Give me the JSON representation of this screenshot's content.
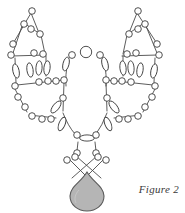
{
  "figure": {
    "caption": "Figure 2",
    "canvas": {
      "width": 185,
      "height": 213
    },
    "background_color": "#ffffff"
  },
  "style": {
    "bead_outline_color": "#3c3c3c",
    "bead_fill_color": "#ffffff",
    "thread_color": "#4a4a4a",
    "pendant_fill_color": "#b5b5b5",
    "pendant_outline_color": "#5a5a5a",
    "thread_width": 0.9,
    "bead_outline_width": 0.9
  },
  "components": {
    "left_wing_label": "left-wing-motif",
    "right_wing_label": "right-wing-motif",
    "center_loop_label": "center-loop-motif",
    "crossover_label": "crossover-strands",
    "pendant_label": "teardrop-pendant"
  },
  "threads": [
    {
      "name": "left-upper-v-left",
      "x1": 31,
      "y1": 13,
      "x2": 13,
      "y2": 41
    },
    {
      "name": "left-upper-v-right",
      "x1": 31,
      "y1": 13,
      "x2": 38,
      "y2": 31
    },
    {
      "name": "left-tri-top-left",
      "x1": 25,
      "y1": 22,
      "x2": 39,
      "y2": 33
    },
    {
      "name": "left-tri-left-side",
      "x1": 23,
      "y1": 24,
      "x2": 14,
      "y2": 52
    },
    {
      "name": "left-tri-right-side",
      "x1": 40,
      "y1": 33,
      "x2": 45,
      "y2": 54
    },
    {
      "name": "left-tri-base",
      "x1": 12,
      "y1": 56,
      "x2": 46,
      "y2": 55
    },
    {
      "name": "left-mid-vert-a",
      "x1": 15,
      "y1": 56,
      "x2": 16,
      "y2": 84
    },
    {
      "name": "left-bar-upper",
      "x1": 16,
      "y1": 84,
      "x2": 64,
      "y2": 80
    },
    {
      "name": "left-lower-left",
      "x1": 15,
      "y1": 88,
      "x2": 28,
      "y2": 113
    },
    {
      "name": "left-lower-base",
      "x1": 28,
      "y1": 115,
      "x2": 57,
      "y2": 118
    },
    {
      "name": "left-inner-vert",
      "x1": 64,
      "y1": 82,
      "x2": 63,
      "y2": 112
    },
    {
      "name": "right-upper-v-left",
      "x1": 137,
      "y1": 13,
      "x2": 147,
      "y2": 33
    },
    {
      "name": "right-upper-v-right",
      "x1": 137,
      "y1": 13,
      "x2": 129,
      "y2": 32
    },
    {
      "name": "right-tri-top-right",
      "x1": 143,
      "y1": 22,
      "x2": 128,
      "y2": 34
    },
    {
      "name": "right-tri-right-side",
      "x1": 146,
      "y1": 25,
      "x2": 157,
      "y2": 53
    },
    {
      "name": "right-tri-left-side",
      "x1": 127,
      "y1": 34,
      "x2": 122,
      "y2": 54
    },
    {
      "name": "right-tri-base",
      "x1": 121,
      "y1": 56,
      "x2": 158,
      "y2": 55
    },
    {
      "name": "right-mid-vert-a",
      "x1": 156,
      "y1": 56,
      "x2": 155,
      "y2": 84
    },
    {
      "name": "right-bar-upper",
      "x1": 155,
      "y1": 84,
      "x2": 106,
      "y2": 80
    },
    {
      "name": "right-lower-right",
      "x1": 156,
      "y1": 88,
      "x2": 143,
      "y2": 113
    },
    {
      "name": "right-lower-base",
      "x1": 142,
      "y1": 115,
      "x2": 114,
      "y2": 118
    },
    {
      "name": "right-inner-vert",
      "x1": 106,
      "y1": 82,
      "x2": 107,
      "y2": 112
    },
    {
      "name": "cross-left",
      "x1": 76,
      "y1": 155,
      "x2": 100,
      "y2": 177
    },
    {
      "name": "cross-right",
      "x1": 96,
      "y1": 155,
      "x2": 72,
      "y2": 177
    },
    {
      "name": "neck-left",
      "x1": 78,
      "y1": 141,
      "x2": 77,
      "y2": 152
    },
    {
      "name": "neck-right",
      "x1": 95,
      "y1": 141,
      "x2": 96,
      "y2": 152
    }
  ],
  "beads": {
    "round_small_radius": 3.2,
    "round_large_radius": 5.6,
    "count_label": "round-bead",
    "bugle_label": "bugle-bead"
  }
}
